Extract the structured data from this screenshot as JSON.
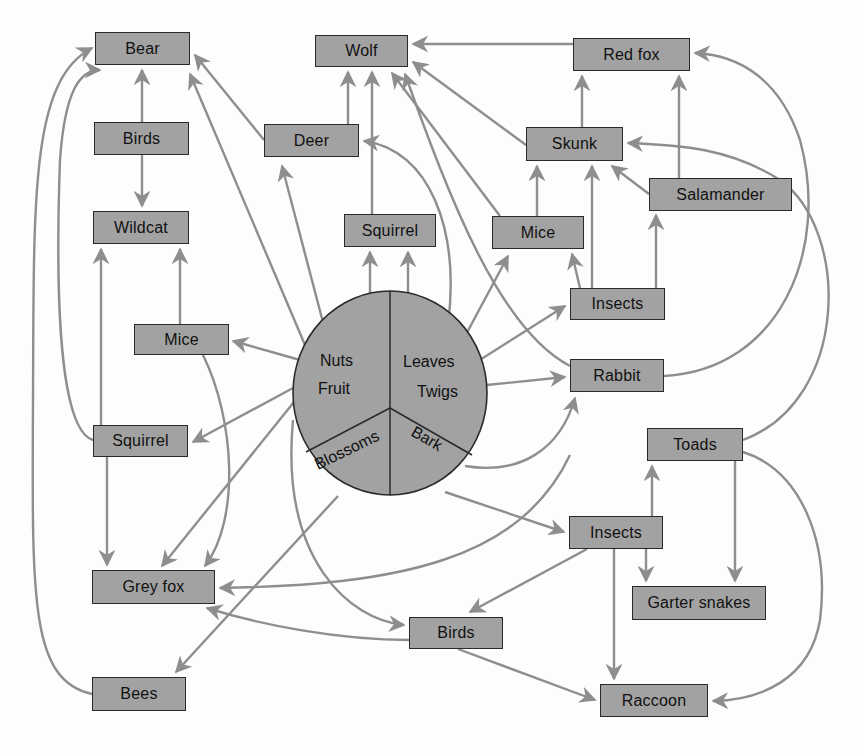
{
  "diagram": {
    "type": "food-web",
    "colors": {
      "node_fill": "#a2a2a2",
      "node_border": "#2a2a2a",
      "edge": "#8e8e8e",
      "background": "#fdfdfc"
    },
    "center": {
      "segments": {
        "nuts": "Nuts",
        "fruit": "Fruit",
        "leaves": "Leaves",
        "twigs": "Twigs",
        "blossoms": "Blossoms",
        "bark": "Bark"
      }
    },
    "nodes": {
      "bear": "Bear",
      "wolf": "Wolf",
      "red_fox": "Red fox",
      "birds_top": "Birds",
      "deer": "Deer",
      "skunk": "Skunk",
      "salamander": "Salamander",
      "wildcat": "Wildcat",
      "squirrel_mid": "Squirrel",
      "mice_mid": "Mice",
      "insects_top": "Insects",
      "mice_left": "Mice",
      "rabbit": "Rabbit",
      "squirrel_left": "Squirrel",
      "toads": "Toads",
      "insects_bottom": "Insects",
      "grey_fox": "Grey fox",
      "garter_snakes": "Garter snakes",
      "birds_bottom": "Birds",
      "bees": "Bees",
      "raccoon": "Raccoon"
    },
    "edges": [
      [
        "Birds",
        "Bear"
      ],
      [
        "Birds",
        "Wildcat"
      ],
      [
        "Deer",
        "Bear"
      ],
      [
        "Deer",
        "Wolf"
      ],
      [
        "Squirrel",
        "Wolf"
      ],
      [
        "Mice",
        "Wolf"
      ],
      [
        "Skunk",
        "Wolf"
      ],
      [
        "Red fox",
        "Wolf"
      ],
      [
        "Rabbit",
        "Wolf"
      ],
      [
        "Skunk",
        "Red fox"
      ],
      [
        "Salamander",
        "Red fox"
      ],
      [
        "Rabbit",
        "Red fox"
      ],
      [
        "Mice",
        "Skunk"
      ],
      [
        "Insects",
        "Skunk"
      ],
      [
        "Salamander",
        "Skunk"
      ],
      [
        "Toads",
        "Skunk"
      ],
      [
        "Insects",
        "Salamander"
      ],
      [
        "Insects",
        "Mice"
      ],
      [
        "Plants",
        "Squirrel"
      ],
      [
        "Plants",
        "Mice"
      ],
      [
        "Plants",
        "Insects"
      ],
      [
        "Plants",
        "Rabbit"
      ],
      [
        "Plants",
        "Deer"
      ],
      [
        "Plants",
        "Bear"
      ],
      [
        "Plants",
        "Wildcat mice"
      ],
      [
        "Mice",
        "Wildcat"
      ],
      [
        "Squirrel",
        "Wildcat"
      ],
      [
        "Squirrel",
        "Bear"
      ],
      [
        "Squirrel",
        "Grey fox"
      ],
      [
        "Mice",
        "Grey fox"
      ],
      [
        "Plants",
        "Grey fox"
      ],
      [
        "Birds",
        "Grey fox"
      ],
      [
        "Bees",
        "Bear"
      ],
      [
        "Plants",
        "Bees"
      ],
      [
        "Plants",
        "Birds"
      ],
      [
        "Insects",
        "Birds"
      ],
      [
        "Insects",
        "Toads"
      ],
      [
        "Insects",
        "Garter snakes"
      ],
      [
        "Toads",
        "Garter snakes"
      ],
      [
        "Insects",
        "Raccoon"
      ],
      [
        "Birds",
        "Raccoon"
      ],
      [
        "Toads",
        "Raccoon"
      ],
      [
        "Bark",
        "Rabbit"
      ],
      [
        "Bark",
        "Insects"
      ]
    ]
  }
}
